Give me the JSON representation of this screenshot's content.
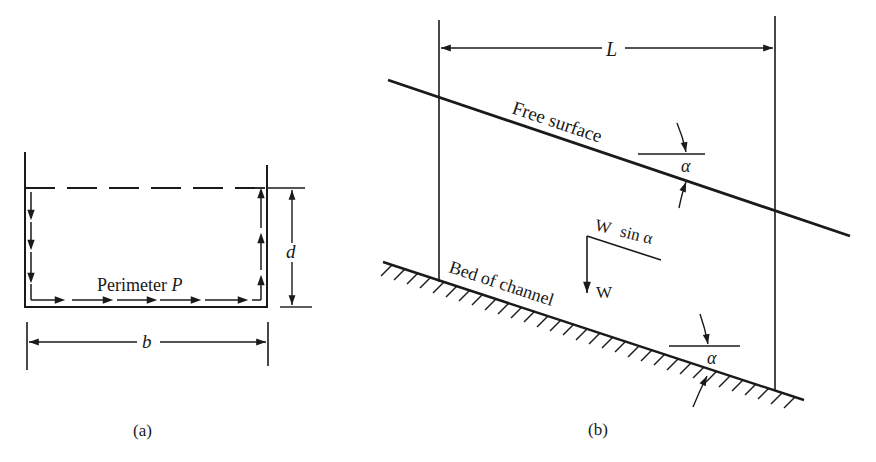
{
  "figure_a": {
    "perimeter_label": "Perimeter",
    "perimeter_symbol": "P",
    "depth_symbol": "d",
    "width_symbol": "b",
    "caption": "(a)"
  },
  "figure_b": {
    "length_symbol": "L",
    "free_surface_label": "Free surface",
    "bed_label": "Bed of channel",
    "weight_symbol": "W",
    "weight_component_label": "W",
    "weight_component_suffix": "sin α",
    "angle_symbol_top": "α",
    "angle_symbol_bottom": "α",
    "caption": "(b)"
  },
  "colors": {
    "ink": "#1a1a1a",
    "background": "#ffffff"
  }
}
